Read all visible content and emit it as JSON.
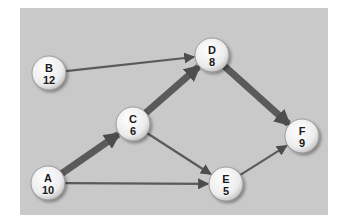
{
  "diagram": {
    "type": "activity-network",
    "background_color": "#c9c9c9",
    "edge_color": "#5a5a5a",
    "nodes": [
      {
        "id": "A",
        "name": "A",
        "value": "10",
        "cx": 48,
        "cy": 183
      },
      {
        "id": "B",
        "name": "B",
        "value": "12",
        "cx": 49,
        "cy": 73
      },
      {
        "id": "C",
        "name": "C",
        "value": "6",
        "cx": 133,
        "cy": 124
      },
      {
        "id": "D",
        "name": "D",
        "value": "8",
        "cx": 212,
        "cy": 55
      },
      {
        "id": "E",
        "name": "E",
        "value": "5",
        "cx": 226,
        "cy": 184
      },
      {
        "id": "F",
        "name": "F",
        "value": "9",
        "cx": 302,
        "cy": 136
      }
    ],
    "edges": [
      {
        "from": "A",
        "to": "C",
        "critical": true
      },
      {
        "from": "C",
        "to": "D",
        "critical": true
      },
      {
        "from": "D",
        "to": "F",
        "critical": true
      },
      {
        "from": "B",
        "to": "D",
        "critical": false
      },
      {
        "from": "C",
        "to": "E",
        "critical": false
      },
      {
        "from": "A",
        "to": "E",
        "critical": false
      },
      {
        "from": "E",
        "to": "F",
        "critical": false
      }
    ]
  }
}
